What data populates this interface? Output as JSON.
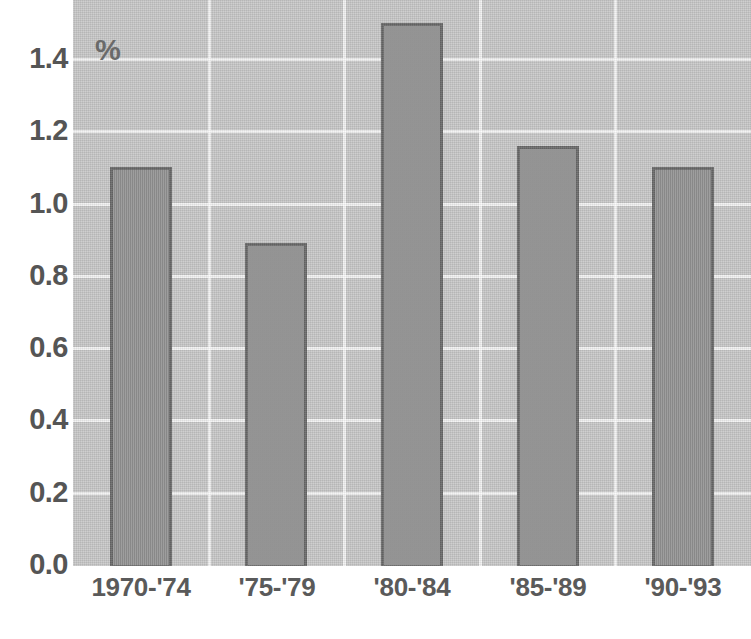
{
  "chart_data": {
    "type": "bar",
    "title": "",
    "subtitle": "",
    "xlabel": "",
    "ylabel": "%",
    "unit_label": "%",
    "categories": [
      "1970-'74",
      "'75-'79",
      "'80-'84",
      "'85-'89",
      "'90-'93"
    ],
    "values": [
      1.1,
      0.89,
      1.5,
      1.16,
      1.1
    ],
    "series": [
      {
        "name": "",
        "values": [
          1.1,
          0.89,
          1.5,
          1.16,
          1.1
        ]
      }
    ],
    "ylim": [
      0.0,
      1.55
    ],
    "yticks": [
      0.0,
      0.2,
      0.4,
      0.6,
      0.8,
      1.0,
      1.2,
      1.4
    ],
    "ytick_labels": [
      "0.0",
      "0.2",
      "0.4",
      "0.6",
      "0.8",
      "1.0",
      "1.2",
      "1.4"
    ],
    "grid": true,
    "grid_orientation": "both",
    "legend": false,
    "legend_position": "none",
    "colors": {
      "plot_background": "#c9c9c9",
      "bar_fill": "#989898",
      "bar_edge": "#6a6a6a",
      "gridline": "#ffffff",
      "tick_label": "#555555",
      "page_background": "#ffffff"
    }
  },
  "axes": {
    "y_ticks": [
      {
        "label": "1.4",
        "value": 1.4
      },
      {
        "label": "1.2",
        "value": 1.2
      },
      {
        "label": "1.0",
        "value": 1.0
      },
      {
        "label": "0.8",
        "value": 0.8
      },
      {
        "label": "0.6",
        "value": 0.6
      },
      {
        "label": "0.4",
        "value": 0.4
      },
      {
        "label": "0.2",
        "value": 0.2
      },
      {
        "label": "0.0",
        "value": 0.0
      }
    ],
    "x_ticks": [
      {
        "label": "1970-'74"
      },
      {
        "label": "'75-'79"
      },
      {
        "label": "'80-'84"
      },
      {
        "label": "'85-'89"
      },
      {
        "label": "'90-'93"
      }
    ]
  },
  "bars": [
    {
      "category": "1970-'74",
      "value": 1.1,
      "value_label": "1.10"
    },
    {
      "category": "'75-'79",
      "value": 0.89,
      "value_label": "0.89"
    },
    {
      "category": "'80-'84",
      "value": 1.5,
      "value_label": "1.50"
    },
    {
      "category": "'85-'89",
      "value": 1.16,
      "value_label": "1.16"
    },
    {
      "category": "'90-'93",
      "value": 1.1,
      "value_label": "1.10"
    }
  ]
}
